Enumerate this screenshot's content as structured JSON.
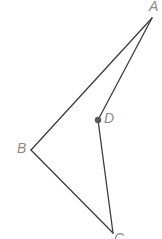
{
  "figure": {
    "type": "geometry-diagram",
    "width": 162,
    "height": 239,
    "background_color": "#ffffff",
    "stroke_color": "#3d3d42",
    "label_color": "#8a8a8a",
    "point_marker_color": "#58585c",
    "stroke_width": 1.3,
    "labels": {
      "a": "A",
      "b": "B",
      "c": "C",
      "d": "D"
    },
    "points": {
      "A": {
        "x": 152,
        "y": 18
      },
      "B": {
        "x": 31,
        "y": 150
      },
      "C": {
        "x": 113,
        "y": 233
      },
      "D": {
        "x": 98,
        "y": 120
      }
    },
    "segments": [
      {
        "name": "segment-AB",
        "from": "A",
        "to": "B"
      },
      {
        "name": "segment-BC",
        "from": "B",
        "to": "C"
      },
      {
        "name": "segment-AD",
        "from": "A",
        "to": "D"
      },
      {
        "name": "segment-DC",
        "from": "D",
        "to": "C"
      }
    ],
    "marked_points": [
      {
        "name": "point-D",
        "at": "D",
        "radius": 3.2
      }
    ]
  }
}
